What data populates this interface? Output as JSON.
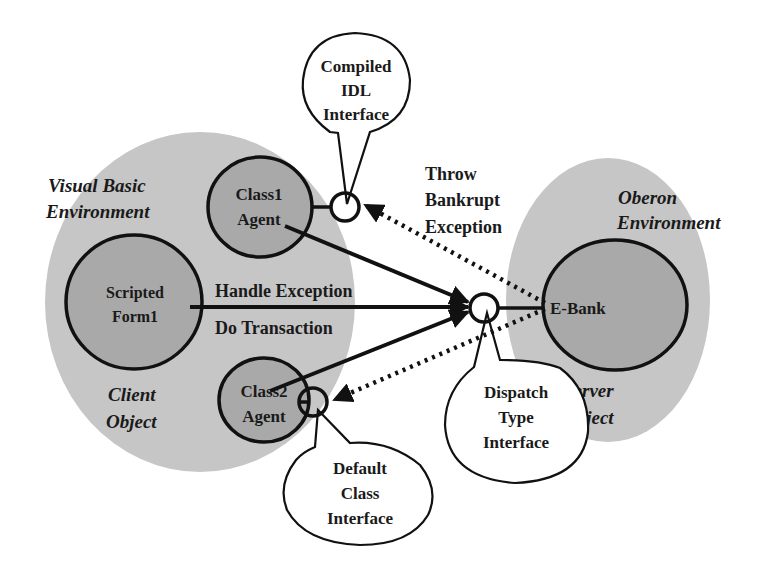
{
  "colors": {
    "environment": "#c6c6c6",
    "object_fill": "#a9a9a9",
    "stroke": "#111111",
    "bubble_fill": "#ffffff"
  },
  "environments": {
    "client": {
      "title_line1": "Visual Basic",
      "title_line2": "Environment",
      "role_line1": "Client",
      "role_line2": "Object"
    },
    "server": {
      "title_line1": "Oberon",
      "title_line2": "Environment",
      "role_line1": "Server",
      "role_line2": "Object"
    }
  },
  "objects": {
    "class1_agent": {
      "line1": "Class1",
      "line2": "Agent"
    },
    "scripted_form1": {
      "line1": "Scripted",
      "line2": "Form1"
    },
    "class2_agent": {
      "line1": "Class2",
      "line2": "Agent"
    },
    "e_bank": {
      "label": "E-Bank"
    }
  },
  "interfaces": {
    "compiled_idl": {
      "line1": "Compiled",
      "line2": "IDL",
      "line3": "Interface"
    },
    "dispatch_type": {
      "line1": "Dispatch",
      "line2": "Type",
      "line3": "Interface"
    },
    "default_class": {
      "line1": "Default",
      "line2": "Class",
      "line3": "Interface"
    }
  },
  "messages": {
    "handle_exception": "Handle Exception",
    "do_transaction": "Do Transaction",
    "throw_bankrupt": {
      "line1": "Throw",
      "line2": "Bankrupt",
      "line3": "Exception"
    }
  },
  "legend": {
    "solid_arrow": "method call",
    "dotted_arrow": "exception / callback"
  }
}
